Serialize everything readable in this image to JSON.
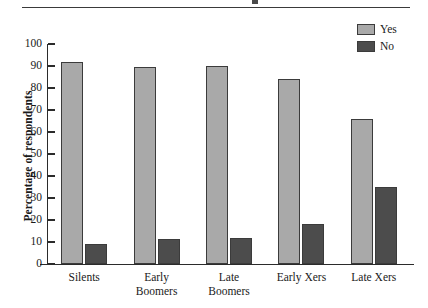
{
  "figure": {
    "background_color": "#ffffff",
    "has_top_rule": true
  },
  "axis": {
    "ylabel": "Percentage of respondents",
    "yticks": [
      0,
      10,
      20,
      30,
      40,
      50,
      60,
      70,
      80,
      90,
      100
    ],
    "ytick_labels": [
      "0",
      "10",
      "20",
      "30",
      "40",
      "50",
      "60",
      "70",
      "80",
      "90",
      "100"
    ]
  },
  "legend": {
    "position": "top-right",
    "items": [
      {
        "label": "Yes",
        "color": "#a9a9a9"
      },
      {
        "label": "No",
        "color": "#4c4c4c"
      }
    ]
  },
  "chart_data": {
    "type": "bar",
    "title": "",
    "subtitle": "",
    "xlabel": "",
    "ylabel": "Percentage of respondents",
    "ylim": [
      0,
      100
    ],
    "ytick_step": 10,
    "grid": false,
    "legend_position": "top-right",
    "categories": [
      "Silents",
      "Early Boomers",
      "Late Boomers",
      "Early Xers",
      "Late Xers"
    ],
    "category_lines": [
      [
        "Silents"
      ],
      [
        "Early",
        "Boomers"
      ],
      [
        "Late",
        "Boomers"
      ],
      [
        "Early Xers"
      ],
      [
        "Late Xers"
      ]
    ],
    "series": [
      {
        "name": "Yes",
        "color": "#a9a9a9",
        "values": [
          92,
          89.5,
          90,
          84,
          66
        ]
      },
      {
        "name": "No",
        "color": "#4c4c4c",
        "values": [
          9,
          11.5,
          12,
          18,
          35
        ]
      }
    ]
  }
}
